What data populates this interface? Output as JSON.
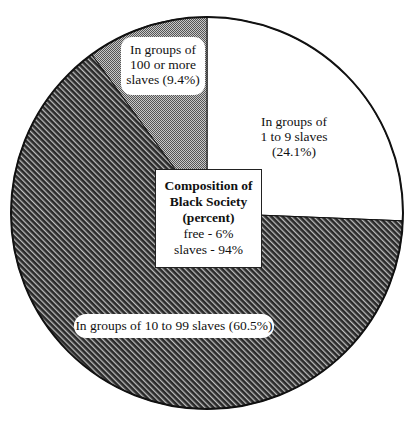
{
  "chart_data": {
    "type": "pie",
    "title": "Composition of Black Society (percent)",
    "categories": [
      "In groups of 1 to 9 slaves",
      "In groups of 10 to 99 slaves",
      "In groups of 100 or more slaves"
    ],
    "values": [
      24.1,
      60.5,
      9.4
    ],
    "fills": [
      "white",
      "diagonal-hatch-dark",
      "fine-checker-gray"
    ],
    "start_angle": "12 o'clock, clockwise",
    "inset": {
      "title_lines": [
        "Composition of",
        "Black Society",
        "(percent)"
      ],
      "free": "free - 6%",
      "slaves": "slaves - 94%"
    },
    "legend": "none (direct labels)"
  },
  "labels": {
    "groups_1_9": [
      "In groups of",
      "1 to 9 slaves",
      "(24.1%)"
    ],
    "groups_10_99": "In groups of 10 to 99 slaves (60.5%)",
    "groups_100": [
      "In groups of",
      "100 or more",
      "slaves (9.4%)"
    ]
  },
  "inset": {
    "line1": "Composition of",
    "line2": "Black Society",
    "line3": "(percent)",
    "line4": "free - 6%",
    "line5": "slaves - 94%"
  },
  "colors": {
    "outline": "#111111",
    "hatch_dark": "#2a2a2a",
    "hatch_light": "#bdbdbd",
    "checker_dark": "#555555",
    "checker_light": "#c8c8c8",
    "background": "#ffffff"
  }
}
